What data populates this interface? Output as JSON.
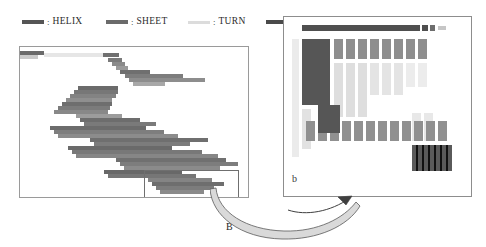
{
  "figure": {
    "caption_left": "B",
    "caption_right": "b",
    "background": "#ffffff"
  },
  "legend": {
    "items": [
      {
        "label": "HELIX",
        "colon": ":",
        "color": "#555555",
        "swatch": "helix-swatch",
        "x": 0,
        "thickness": 4
      },
      {
        "label": "SHEET",
        "colon": ":",
        "color": "#6b6b6b",
        "swatch": "sheet-swatch",
        "x": 84,
        "thickness": 4
      },
      {
        "label": "TURN",
        "colon": ":",
        "color": "#dcdcdc",
        "swatch": "turn-swatch",
        "x": 166,
        "thickness": 3
      },
      {
        "label": "COIL",
        "colon": ":",
        "color": "#4a4a4a",
        "swatch": "coil-swatch",
        "x": 244,
        "thickness": 4
      }
    ]
  },
  "panel_left": {
    "name": "secondary-structure-alignment-overview",
    "border_color": "#9a9a9a",
    "width": 228,
    "height": 150,
    "selection_box": {
      "x": 124,
      "y": 123,
      "width": 93,
      "height": 27,
      "color": "#6f6f6f"
    },
    "segments": [
      {
        "x": 0,
        "y": 4,
        "w": 24,
        "color": "#6a6a6a"
      },
      {
        "x": 0,
        "y": 8,
        "w": 18,
        "color": "#c9c9c9"
      },
      {
        "x": 24,
        "y": 6,
        "w": 62,
        "color": "#e6e6e6"
      },
      {
        "x": 83,
        "y": 6,
        "w": 16,
        "color": "#707070"
      },
      {
        "x": 88,
        "y": 11,
        "w": 14,
        "color": "#7a7a7a"
      },
      {
        "x": 92,
        "y": 15,
        "w": 13,
        "color": "#8a8a8a"
      },
      {
        "x": 96,
        "y": 19,
        "w": 12,
        "color": "#9a9a9a"
      },
      {
        "x": 100,
        "y": 23,
        "w": 30,
        "color": "#6f6f6f"
      },
      {
        "x": 105,
        "y": 27,
        "w": 58,
        "color": "#7d7d7d"
      },
      {
        "x": 109,
        "y": 31,
        "w": 76,
        "color": "#8d8d8d"
      },
      {
        "x": 113,
        "y": 35,
        "w": 32,
        "color": "#a8a8a8"
      },
      {
        "x": 58,
        "y": 39,
        "w": 40,
        "color": "#6b6b6b"
      },
      {
        "x": 54,
        "y": 43,
        "w": 44,
        "color": "#777777"
      },
      {
        "x": 50,
        "y": 47,
        "w": 46,
        "color": "#838383"
      },
      {
        "x": 46,
        "y": 51,
        "w": 46,
        "color": "#8f8f8f"
      },
      {
        "x": 42,
        "y": 55,
        "w": 50,
        "color": "#6e6e6e"
      },
      {
        "x": 38,
        "y": 59,
        "w": 52,
        "color": "#7b7b7b"
      },
      {
        "x": 34,
        "y": 63,
        "w": 54,
        "color": "#888888"
      },
      {
        "x": 56,
        "y": 67,
        "w": 46,
        "color": "#9c9c9c"
      },
      {
        "x": 60,
        "y": 71,
        "w": 60,
        "color": "#6d6d6d"
      },
      {
        "x": 64,
        "y": 75,
        "w": 72,
        "color": "#7a7a7a"
      },
      {
        "x": 30,
        "y": 79,
        "w": 96,
        "color": "#6c6c6c"
      },
      {
        "x": 34,
        "y": 83,
        "w": 110,
        "color": "#7e7e7e"
      },
      {
        "x": 38,
        "y": 87,
        "w": 120,
        "color": "#8c8c8c"
      },
      {
        "x": 70,
        "y": 91,
        "w": 118,
        "color": "#6f6f6f"
      },
      {
        "x": 74,
        "y": 95,
        "w": 96,
        "color": "#7c7c7c"
      },
      {
        "x": 48,
        "y": 99,
        "w": 104,
        "color": "#6a6a6a"
      },
      {
        "x": 52,
        "y": 103,
        "w": 130,
        "color": "#787878"
      },
      {
        "x": 56,
        "y": 107,
        "w": 142,
        "color": "#868686"
      },
      {
        "x": 96,
        "y": 111,
        "w": 110,
        "color": "#707070"
      },
      {
        "x": 100,
        "y": 115,
        "w": 118,
        "color": "#7d7d7d"
      },
      {
        "x": 104,
        "y": 119,
        "w": 96,
        "color": "#8b8b8b"
      },
      {
        "x": 84,
        "y": 123,
        "w": 78,
        "color": "#686868"
      },
      {
        "x": 88,
        "y": 127,
        "w": 88,
        "color": "#767676"
      },
      {
        "x": 128,
        "y": 131,
        "w": 64,
        "color": "#848484"
      },
      {
        "x": 132,
        "y": 135,
        "w": 72,
        "color": "#6e6e6e"
      },
      {
        "x": 136,
        "y": 139,
        "w": 58,
        "color": "#7c7c7c"
      },
      {
        "x": 140,
        "y": 143,
        "w": 44,
        "color": "#8a8a8a"
      }
    ]
  },
  "panel_right": {
    "name": "magnified-alignment-detail",
    "border_color": "#8d8d8d",
    "width": 187,
    "height": 179,
    "top_bar": {
      "x": 18,
      "y": 8,
      "w": 118,
      "h": 6,
      "color": "#4f4f4f"
    },
    "top_bar_trail": [
      {
        "x": 138,
        "y": 8,
        "w": 6,
        "h": 6,
        "color": "#4f4f4f"
      },
      {
        "x": 146,
        "y": 8,
        "w": 5,
        "h": 6,
        "color": "#6d6d6d"
      },
      {
        "x": 154,
        "y": 9,
        "w": 8,
        "h": 4,
        "color": "#c6c6c6"
      }
    ],
    "big_block": {
      "x": 18,
      "y": 22,
      "w": 28,
      "h": 66,
      "color": "#565656"
    },
    "stem_block": {
      "x": 34,
      "y": 88,
      "w": 22,
      "h": 28,
      "color": "#565656"
    },
    "row_blocks": [
      {
        "x": 50,
        "y": 22,
        "w": 9,
        "h": 20,
        "color": "#8e8e8e"
      },
      {
        "x": 62,
        "y": 22,
        "w": 9,
        "h": 20,
        "color": "#8e8e8e"
      },
      {
        "x": 74,
        "y": 22,
        "w": 9,
        "h": 20,
        "color": "#8e8e8e"
      },
      {
        "x": 86,
        "y": 22,
        "w": 9,
        "h": 20,
        "color": "#8e8e8e"
      },
      {
        "x": 98,
        "y": 22,
        "w": 9,
        "h": 20,
        "color": "#8e8e8e"
      },
      {
        "x": 110,
        "y": 22,
        "w": 9,
        "h": 20,
        "color": "#8e8e8e"
      },
      {
        "x": 122,
        "y": 22,
        "w": 9,
        "h": 20,
        "color": "#8e8e8e"
      },
      {
        "x": 134,
        "y": 22,
        "w": 9,
        "h": 20,
        "color": "#8e8e8e"
      }
    ],
    "band_blocks": [
      {
        "x": 22,
        "y": 104,
        "w": 9,
        "h": 20,
        "color": "#909090"
      },
      {
        "x": 34,
        "y": 104,
        "w": 9,
        "h": 20,
        "color": "#909090"
      },
      {
        "x": 46,
        "y": 104,
        "w": 9,
        "h": 20,
        "color": "#909090"
      },
      {
        "x": 58,
        "y": 104,
        "w": 9,
        "h": 20,
        "color": "#909090"
      },
      {
        "x": 70,
        "y": 104,
        "w": 9,
        "h": 20,
        "color": "#909090"
      },
      {
        "x": 82,
        "y": 104,
        "w": 9,
        "h": 20,
        "color": "#909090"
      },
      {
        "x": 94,
        "y": 104,
        "w": 9,
        "h": 20,
        "color": "#909090"
      },
      {
        "x": 106,
        "y": 104,
        "w": 9,
        "h": 20,
        "color": "#909090"
      },
      {
        "x": 118,
        "y": 104,
        "w": 9,
        "h": 20,
        "color": "#909090"
      },
      {
        "x": 130,
        "y": 104,
        "w": 9,
        "h": 20,
        "color": "#909090"
      },
      {
        "x": 142,
        "y": 104,
        "w": 9,
        "h": 20,
        "color": "#909090"
      },
      {
        "x": 154,
        "y": 104,
        "w": 9,
        "h": 20,
        "color": "#909090"
      }
    ],
    "striped_block": {
      "x": 128,
      "y": 128,
      "w": 40,
      "h": 26,
      "color": "#5a5a5a",
      "stripe_color": "#111111"
    },
    "faint_columns": [
      {
        "x": 8,
        "y": 22,
        "w": 7,
        "h": 118,
        "color": "#ebebeb"
      },
      {
        "x": 50,
        "y": 46,
        "w": 9,
        "h": 54,
        "color": "#dedede"
      },
      {
        "x": 62,
        "y": 46,
        "w": 9,
        "h": 54,
        "color": "#dedede"
      },
      {
        "x": 74,
        "y": 46,
        "w": 9,
        "h": 54,
        "color": "#dedede"
      },
      {
        "x": 86,
        "y": 46,
        "w": 9,
        "h": 32,
        "color": "#e4e4e4"
      },
      {
        "x": 98,
        "y": 46,
        "w": 9,
        "h": 32,
        "color": "#e4e4e4"
      },
      {
        "x": 110,
        "y": 46,
        "w": 9,
        "h": 32,
        "color": "#e4e4e4"
      },
      {
        "x": 122,
        "y": 46,
        "w": 9,
        "h": 24,
        "color": "#ececec"
      },
      {
        "x": 134,
        "y": 46,
        "w": 9,
        "h": 24,
        "color": "#ececec"
      },
      {
        "x": 18,
        "y": 92,
        "w": 9,
        "h": 40,
        "color": "#e2e2e2"
      },
      {
        "x": 128,
        "y": 96,
        "w": 9,
        "h": 28,
        "color": "#e8e8e8"
      },
      {
        "x": 140,
        "y": 96,
        "w": 9,
        "h": 28,
        "color": "#e8e8e8"
      }
    ]
  },
  "connector": {
    "name": "zoom-callout-arrow",
    "ribbon_fill": "#d9d9d9",
    "stroke": "#4a4a4a"
  }
}
